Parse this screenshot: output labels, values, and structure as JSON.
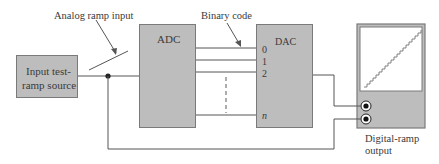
{
  "diagram": {
    "source_block": {
      "label_line1": "Input test-",
      "label_line2": "ramp source"
    },
    "adc_block": {
      "label": "ADC"
    },
    "dac_block": {
      "label": "DAC",
      "bit_labels": [
        "0",
        "1",
        "2",
        "n"
      ]
    },
    "scope": {
      "label_line1": "Digital-ramp",
      "label_line2": "output"
    },
    "annotations": {
      "analog_input": "Analog ramp input",
      "binary_code": "Binary code"
    },
    "colors": {
      "block_fill": "#bdbdbd",
      "block_border": "#7a7a7a",
      "line": "#555555",
      "text": "#3a3a3a",
      "screen": "#ffffff"
    }
  }
}
